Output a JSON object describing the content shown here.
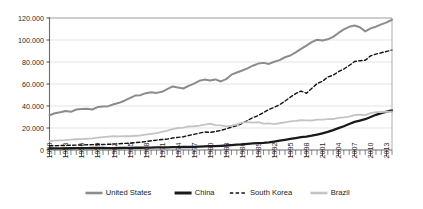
{
  "chart_data": {
    "type": "line",
    "title": "",
    "subtitle": "",
    "xlabel": "",
    "ylabel": "",
    "xlim": [
      1950,
      2014
    ],
    "ylim": [
      0,
      120000
    ],
    "grid": "horizontal",
    "legend_position": "bottom",
    "y_ticks": [
      0,
      20000,
      40000,
      60000,
      80000,
      100000,
      120000
    ],
    "y_tick_labels": [
      "0",
      "20.000",
      "40.000",
      "60.000",
      "80.000",
      "100.000",
      "120.000"
    ],
    "x_tick_labels": [
      "1950",
      "1953",
      "1956",
      "1959",
      "1962",
      "1965",
      "1968",
      "1971",
      "1974",
      "1977",
      "1980",
      "1983",
      "1986",
      "1989",
      "1992",
      "1995",
      "1998",
      "2001",
      "2004",
      "2007",
      "2010",
      "2013"
    ],
    "x_tick_step": 3,
    "x_minor_tick_step": 1,
    "x": [
      1950,
      1951,
      1952,
      1953,
      1954,
      1955,
      1956,
      1957,
      1958,
      1959,
      1960,
      1961,
      1962,
      1963,
      1964,
      1965,
      1966,
      1967,
      1968,
      1969,
      1970,
      1971,
      1972,
      1973,
      1974,
      1975,
      1976,
      1977,
      1978,
      1979,
      1980,
      1981,
      1982,
      1983,
      1984,
      1985,
      1986,
      1987,
      1988,
      1989,
      1990,
      1991,
      1992,
      1993,
      1994,
      1995,
      1996,
      1997,
      1998,
      1999,
      2000,
      2001,
      2002,
      2003,
      2004,
      2005,
      2006,
      2007,
      2008,
      2009,
      2010,
      2011,
      2012,
      2013,
      2014
    ],
    "series": [
      {
        "name": "United States",
        "color": "#8c8c8c",
        "style": "solid",
        "width": 2.0,
        "values": [
          39500,
          41800,
          42800,
          44300,
          43400,
          46000,
          46700,
          47000,
          46000,
          48800,
          49300,
          49800,
          52000,
          53600,
          56000,
          58900,
          61900,
          62300,
          64600,
          65700,
          64900,
          66100,
          69100,
          72200,
          71000,
          69900,
          72900,
          75400,
          78600,
          80000,
          78900,
          80200,
          77900,
          80500,
          85600,
          88100,
          90300,
          92700,
          95800,
          98200,
          99000,
          97800,
          100300,
          102100,
          105400,
          107400,
          111000,
          114900,
          118600,
          122500,
          125300,
          124500,
          125800,
          128600,
          133000,
          137000,
          140000,
          141500,
          139500,
          134800,
          138200,
          140100,
          142800,
          145100,
          148000
        ]
      },
      {
        "name": "China",
        "color": "#1a1a1a",
        "style": "solid",
        "width": 2.3,
        "values": [
          1800,
          1850,
          1900,
          1950,
          2000,
          2050,
          2150,
          2200,
          2300,
          2350,
          2300,
          2100,
          2150,
          2250,
          2400,
          2500,
          2600,
          2550,
          2600,
          2750,
          2900,
          3000,
          3050,
          3200,
          3250,
          3400,
          3400,
          3600,
          3900,
          4150,
          4300,
          4450,
          4750,
          5100,
          5600,
          6100,
          6500,
          7050,
          7600,
          7850,
          8100,
          8700,
          9600,
          10600,
          11600,
          12600,
          13600,
          14600,
          15300,
          16300,
          17600,
          19000,
          20500,
          22500,
          24800,
          27000,
          29500,
          32000,
          33500,
          35000,
          37500,
          40000,
          42000,
          43500,
          45000
        ]
      },
      {
        "name": "South Korea",
        "color": "#111111",
        "style": "dashed",
        "width": 1.4,
        "values": [
          4800,
          4900,
          5000,
          5200,
          5400,
          5600,
          5700,
          5900,
          6100,
          6200,
          6300,
          6500,
          6700,
          7100,
          7500,
          7800,
          8400,
          8900,
          9600,
          10500,
          11200,
          11900,
          12400,
          13600,
          14300,
          15000,
          16500,
          17700,
          19200,
          20500,
          20000,
          21000,
          22200,
          24000,
          26000,
          27500,
          30200,
          33500,
          36800,
          39200,
          42500,
          46000,
          48500,
          51500,
          55500,
          60000,
          64000,
          67000,
          64500,
          70000,
          75500,
          78000,
          83000,
          85000,
          89000,
          92000,
          96000,
          100500,
          101500,
          102000,
          107000,
          109000,
          110500,
          112000,
          113500
        ]
      },
      {
        "name": "Brazil",
        "color": "#c4c4c4",
        "style": "solid",
        "width": 1.8,
        "values": [
          10200,
          10600,
          11000,
          11200,
          11800,
          12200,
          12300,
          12800,
          13300,
          14000,
          14600,
          15100,
          15600,
          15500,
          15800,
          15600,
          16200,
          16500,
          17400,
          18300,
          19300,
          20600,
          22000,
          23600,
          25000,
          25500,
          26800,
          27000,
          27800,
          28800,
          30000,
          28200,
          28000,
          26800,
          27800,
          29000,
          31000,
          31600,
          31000,
          31600,
          30000,
          30200,
          29500,
          30400,
          31500,
          32500,
          33000,
          33800,
          33600,
          33500,
          34500,
          34600,
          35000,
          35200,
          36500,
          37000,
          38000,
          39500,
          40200,
          39600,
          42000,
          43000,
          43200,
          43500,
          43400
        ]
      }
    ],
    "legend": [
      {
        "label": "United States",
        "color": "#8c8c8c",
        "style": "solid",
        "width": 2.6
      },
      {
        "label": "China",
        "color": "#1a1a1a",
        "style": "solid",
        "width": 3.0
      },
      {
        "label": "South Korea",
        "color": "#111111",
        "style": "dashed",
        "width": 1.5
      },
      {
        "label": "Brazil",
        "color": "#c4c4c4",
        "style": "solid",
        "width": 2.6
      }
    ]
  }
}
